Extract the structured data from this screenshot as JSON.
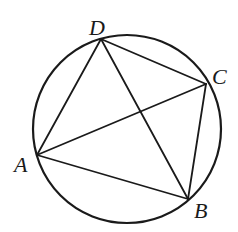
{
  "figure": {
    "type": "inscribed-quadrilateral",
    "circle": {
      "cx": 127,
      "cy": 129,
      "r": 94
    },
    "points": {
      "A": {
        "x": 37,
        "y": 155
      },
      "B": {
        "x": 188,
        "y": 199
      },
      "C": {
        "x": 206,
        "y": 84
      },
      "D": {
        "x": 101,
        "y": 39
      }
    },
    "segments": [
      [
        "A",
        "B"
      ],
      [
        "B",
        "C"
      ],
      [
        "C",
        "D"
      ],
      [
        "D",
        "A"
      ],
      [
        "A",
        "C"
      ],
      [
        "B",
        "D"
      ]
    ],
    "labels": [
      {
        "text": "D",
        "x": 89,
        "y": 35
      },
      {
        "text": "C",
        "x": 212,
        "y": 84
      },
      {
        "text": "A",
        "x": 14,
        "y": 172
      },
      {
        "text": "B",
        "x": 194,
        "y": 218
      }
    ],
    "stroke_color": "#1a1a1a"
  }
}
